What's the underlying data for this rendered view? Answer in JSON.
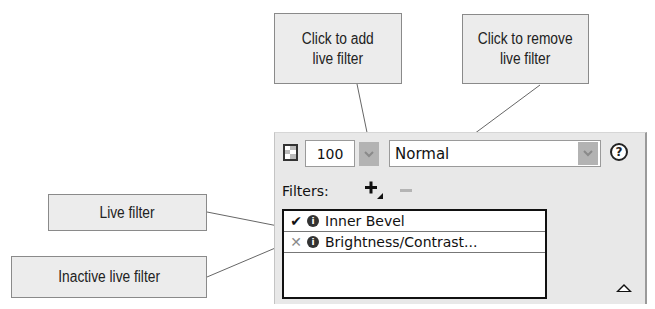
{
  "callouts": {
    "add": {
      "line1": "Click to add",
      "line2": "live filter"
    },
    "remove": {
      "line1": "Click to remove",
      "line2": "live filter"
    },
    "live": {
      "label": "Live filter"
    },
    "inactive": {
      "label": "Inactive live filter"
    }
  },
  "panel": {
    "opacity_value": "100",
    "blend_mode": "Normal",
    "filters_label": "Filters:",
    "help_icon": "?",
    "filters": [
      {
        "state": "✔",
        "state_name": "active",
        "info_icon": "i",
        "name": "Inner Bevel"
      },
      {
        "state": "✕",
        "state_name": "inactive",
        "info_icon": "i",
        "name": "Brightness/Contrast..."
      }
    ]
  },
  "colors": {
    "callout_bg": "#ececec",
    "panel_bg": "#e8e8e8",
    "dropdown_button": "#b3b3b3",
    "inactive_x": "#8a8a8a"
  }
}
